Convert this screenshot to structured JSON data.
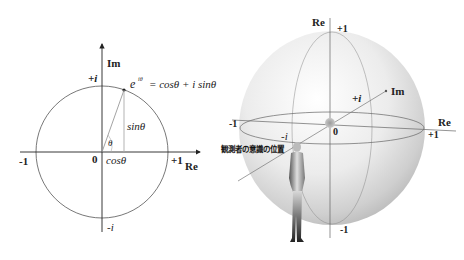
{
  "unit_circle": {
    "axis_im": "Im",
    "axis_re": "Re",
    "plus_i": "+i",
    "minus_i": "-i",
    "minus_one": "-1",
    "plus_one": "+1",
    "origin": "0",
    "theta": "θ",
    "cos": "cosθ",
    "sin": "sinθ",
    "euler_base": "e",
    "euler_exp": "iθ",
    "euler_rhs": "= cosθ + i sinθ"
  },
  "sphere": {
    "axis_re_top": "Re",
    "top_label": "+1",
    "bottom_label": "-1",
    "axis_im": "Im",
    "plus_i": "+i",
    "minus_i": "-i",
    "left_label": "-1",
    "right_label": "+1",
    "axis_re_right": "Re",
    "origin": "0",
    "observer_label": "観測者の意識の位置"
  }
}
